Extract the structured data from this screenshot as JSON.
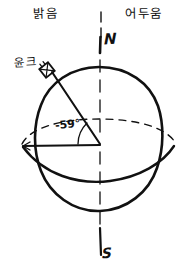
{
  "figure": {
    "type": "hand-drawn-diagram",
    "background_color": "#ffffff",
    "ink_color": "#111111"
  },
  "labels": {
    "bright_side": "밝음",
    "dark_side": "어두움",
    "site": "윤크",
    "north_pole": "N",
    "south_pole": "S",
    "angle": "-59°"
  },
  "icons": {
    "site_marker": "antenna-square-icon"
  },
  "geometry": {
    "sphere": {
      "center_x": 99,
      "center_y": 144,
      "radius": 77
    },
    "axis": {
      "label_top": "N",
      "label_bottom": "S",
      "dashed": true
    },
    "equator": {
      "style": "dashed-ellipse-arc"
    },
    "terminator": {
      "style": "solid-arc"
    },
    "angle_value_deg": -59,
    "angle_vertex": "sphere-center",
    "angle_arms": [
      "horizontal-radius-left",
      "site-radius"
    ]
  }
}
